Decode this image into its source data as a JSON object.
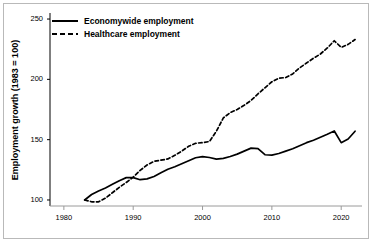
{
  "chart_data": {
    "type": "line",
    "title": "",
    "subtitle": "",
    "xlabel": "",
    "ylabel": "Employment growth (1983 = 100)",
    "xlim": [
      1978,
      2023
    ],
    "ylim": [
      95,
      255
    ],
    "xticks": [
      1980,
      1990,
      2000,
      2010,
      2020
    ],
    "xtick_labels": [
      "1980",
      "1990",
      "2000",
      "2010",
      "2020"
    ],
    "yticks": [
      100,
      150,
      200,
      250
    ],
    "ytick_labels": [
      "100",
      "150",
      "200",
      "250"
    ],
    "grid": false,
    "legend_position": "top-left",
    "x": [
      1983,
      1984,
      1985,
      1986,
      1987,
      1988,
      1989,
      1990,
      1991,
      1992,
      1993,
      1994,
      1995,
      1996,
      1997,
      1998,
      1999,
      2000,
      2001,
      2002,
      2003,
      2004,
      2005,
      2006,
      2007,
      2008,
      2009,
      2010,
      2011,
      2012,
      2013,
      2014,
      2015,
      2016,
      2017,
      2018,
      2019,
      2020,
      2021,
      2022
    ],
    "series": [
      {
        "name": "Economywide employment",
        "style": "solid",
        "color": "#000000",
        "values": [
          100,
          104.5,
          107.5,
          110,
          113,
          116,
          118.5,
          118.5,
          116.8,
          117.5,
          119.5,
          122.5,
          125.5,
          127.5,
          130,
          132.5,
          135,
          136,
          135.2,
          133.8,
          134.5,
          136,
          138,
          140.5,
          143,
          142.5,
          137.5,
          137.2,
          138.5,
          140.5,
          142.5,
          145,
          147.5,
          149.5,
          152,
          154.5,
          157.2,
          147.5,
          150.5,
          157
        ]
      },
      {
        "name": "Healthcare employment",
        "style": "dashed",
        "color": "#000000",
        "values": [
          100,
          98.5,
          98.5,
          101.5,
          106,
          110.5,
          114.5,
          119,
          124.5,
          129,
          132,
          133,
          134,
          137,
          140.5,
          144.5,
          147,
          147.5,
          148.5,
          157,
          168,
          172.5,
          175,
          178.5,
          182.5,
          188,
          193,
          198,
          201,
          201.5,
          204.5,
          209.5,
          213.5,
          217.5,
          221,
          226,
          232,
          226.5,
          229,
          233
        ]
      }
    ],
    "annotations": []
  },
  "legend": {
    "items": [
      {
        "label": "Economywide employment",
        "style": "solid"
      },
      {
        "label": "Healthcare employment",
        "style": "dashed"
      }
    ]
  }
}
